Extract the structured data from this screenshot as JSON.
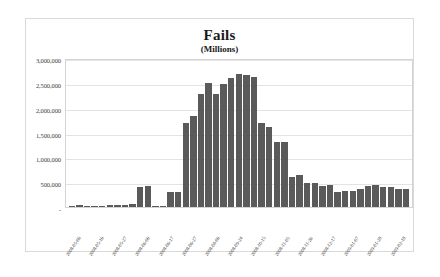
{
  "chart_data": {
    "type": "bar",
    "title": "Fails",
    "subtitle": "(Millions)",
    "xlabel": "",
    "ylabel": "",
    "ylim": [
      0,
      3000000
    ],
    "grid": true,
    "legend": "none",
    "bar_color": "#5a5a5a",
    "ytick_labels": [
      "3,000,000",
      "2,500,000",
      "2,000,000",
      "1,500,000",
      "1,000,000",
      "500,000",
      "-"
    ],
    "ytick_values": [
      3000000,
      2500000,
      2000000,
      1500000,
      1000000,
      500000,
      0
    ],
    "categories": [
      "2008-05-06",
      "2008-05-09",
      "2008-05-13",
      "2008-05-16",
      "2008-05-20",
      "2008-05-23",
      "2008-05-27",
      "2008-05-30",
      "2008-06-03",
      "2008-06-06",
      "2008-06-10",
      "2008-06-13",
      "2008-06-17",
      "2008-06-20",
      "2008-06-24",
      "2008-06-27",
      "2008-07-01",
      "2008-07-08",
      "2008-08-06",
      "2008-09-10",
      "2008-09-17",
      "2008-09-24",
      "2008-10-01",
      "2008-10-08",
      "2008-10-15",
      "2008-10-22",
      "2008-10-29",
      "2008-11-05",
      "2008-11-12",
      "2008-11-19",
      "2008-11-26",
      "2008-12-03",
      "2008-12-10",
      "2008-12-17",
      "2008-12-24",
      "2008-12-31",
      "2009-01-07",
      "2009-01-14",
      "2009-01-21",
      "2009-01-28",
      "2009-02-04",
      "2009-02-11",
      "2009-02-18",
      "2009-02-25",
      "2009-03-04"
    ],
    "xtick_labels_shown": [
      "2008-05-06",
      "2008-05-13",
      "2008-05-27",
      "2008-06-03",
      "2008-06-17",
      "2008-06-24",
      "2008-08-06",
      "2008-10-15",
      "2008-10-29",
      "2008-11-05",
      "2008-11-19",
      "2008-11-26",
      "2008-12-10",
      "2008-12-17",
      "2008-12-31"
    ],
    "values": [
      30000,
      45000,
      30000,
      25000,
      22000,
      35000,
      40000,
      48000,
      52000,
      400000,
      420000,
      20000,
      25000,
      300000,
      305000,
      1690000,
      1830000,
      2280000,
      2490000,
      2270000,
      2470000,
      2600000,
      2670000,
      2650000,
      2610000,
      1690000,
      1620000,
      1310000,
      1310000,
      600000,
      640000,
      480000,
      490000,
      420000,
      435000,
      305000,
      325000,
      315000,
      355000,
      420000,
      450000,
      395000,
      405000,
      360000,
      370000
    ]
  }
}
